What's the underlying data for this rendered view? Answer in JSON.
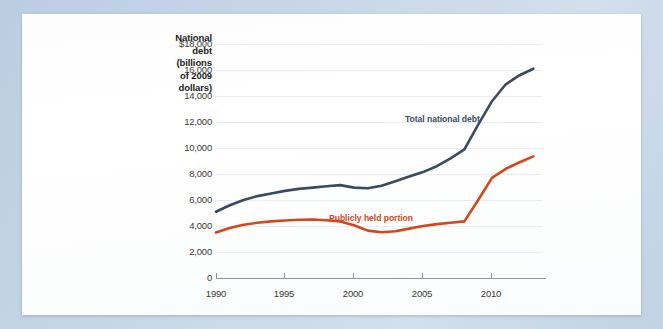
{
  "axis_title": "National debt (billions of 2009 dollars)",
  "axis_title_lines": [
    "National",
    "debt",
    "(billions",
    "of 2009",
    "dollars)"
  ],
  "colors": {
    "total_debt_line": "#3a4b5e",
    "publicly_held_line": "#d2481d",
    "gridline": "#e9ebee",
    "axis": "#8d8f93",
    "card_background": "#ffffff",
    "page_background": "#c6d6e6",
    "tick_text": "#3a3a3a"
  },
  "series_labels": {
    "total": "Total national debt",
    "public": "Publicly held portion"
  },
  "chart_data": {
    "type": "line",
    "title": "",
    "xlabel": "",
    "ylabel": "National debt (billions of 2009 dollars)",
    "grid": true,
    "legend_position": "inline-annotation",
    "xlim": [
      1990,
      2013
    ],
    "ylim": [
      0,
      18000
    ],
    "xticks": [
      1990,
      1995,
      2000,
      2005,
      2010
    ],
    "xtick_labels": [
      "1990",
      "1995",
      "2000",
      "2005",
      "2010"
    ],
    "yticks": [
      0,
      2000,
      4000,
      6000,
      8000,
      10000,
      12000,
      14000,
      16000,
      18000
    ],
    "ytick_labels": [
      "0",
      "2,000",
      "4,000",
      "6,000",
      "8,000",
      "10,000",
      "12,000",
      "14,000",
      "16,000",
      "$18,000"
    ],
    "x": [
      1990,
      1991,
      1992,
      1993,
      1994,
      1995,
      1996,
      1997,
      1998,
      1999,
      2000,
      2001,
      2002,
      2003,
      2004,
      2005,
      2006,
      2007,
      2008,
      2009,
      2010,
      2011,
      2012,
      2013
    ],
    "series": [
      {
        "name": "Total national debt",
        "color": "#3a4b5e",
        "values": [
          5100,
          5600,
          6000,
          6300,
          6500,
          6700,
          6850,
          6950,
          7050,
          7150,
          6950,
          6900,
          7100,
          7450,
          7800,
          8150,
          8600,
          9200,
          9900,
          11800,
          13600,
          14900,
          15600,
          16100
        ]
      },
      {
        "name": "Publicly held portion",
        "color": "#d2481d",
        "values": [
          3500,
          3850,
          4100,
          4250,
          4350,
          4420,
          4480,
          4500,
          4450,
          4350,
          4050,
          3650,
          3520,
          3600,
          3800,
          4000,
          4150,
          4250,
          4350,
          6000,
          7700,
          8400,
          8900,
          9350
        ]
      }
    ]
  }
}
